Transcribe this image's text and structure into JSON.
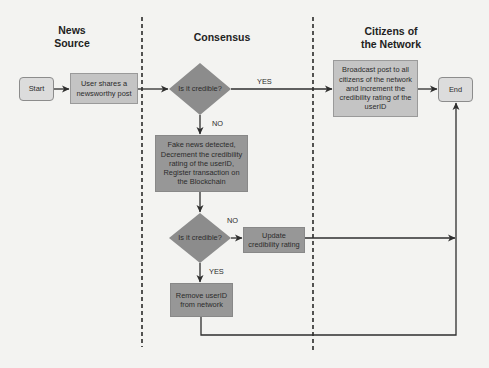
{
  "lanes": [
    {
      "header_line1": "News",
      "header_line2": "Source"
    },
    {
      "header_line1": "Consensus"
    },
    {
      "header_line1": "Citizens of",
      "header_line2": "the Network"
    }
  ],
  "nodes": {
    "start": "Start",
    "user_shares": [
      "User shares a",
      "newsworthy post"
    ],
    "decision1": "Is it credible?",
    "broadcast": [
      "Broadcast post to all",
      "citizens of the network",
      "and increment the",
      "credibility rating of the",
      "userID"
    ],
    "end": "End",
    "fake_news": [
      "Fake news detected,",
      "Decrement the credibility",
      "rating of the userID,",
      "Register transaction on",
      "the Blockchain"
    ],
    "decision2": "Is it credible?",
    "update": [
      "Update",
      "credibility rating"
    ],
    "remove": [
      "Remove userID",
      "from network"
    ]
  },
  "edge_labels": {
    "d1_yes": "YES",
    "d1_no": "NO",
    "d2_no": "NO",
    "d2_yes": "YES"
  },
  "colors": {
    "background": "#f3f3f1",
    "terminal_fill": "#dcdcdc",
    "light_process_fill": "#c4c4c4",
    "dark_process_fill": "#979797",
    "decision_fill": "#8c8c8c",
    "line": "#2e2e2e"
  }
}
